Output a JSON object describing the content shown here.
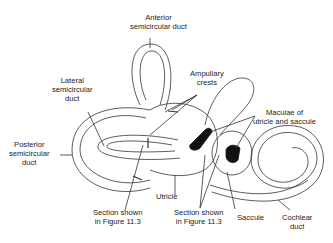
{
  "diagram": {
    "type": "anatomical-illustration",
    "colors": {
      "line": "#333333",
      "fill_dark": "#111111",
      "background": "#ffffff",
      "text": "#222222"
    },
    "labels": {
      "anterior": {
        "line1": "Anterior",
        "line2": "semicircular duct"
      },
      "lateral": {
        "line1": "Lateral",
        "line2": "semicircular",
        "line3": "duct"
      },
      "ampullary": {
        "line1": "Ampullary",
        "line2": "crests"
      },
      "maculae": {
        "line1": "Maculae of",
        "line2": "utricle and saccule"
      },
      "posterior": {
        "line1": "Posterior",
        "line2": "semicircular",
        "line3": "duct"
      },
      "utricle": {
        "line1": "Utricle"
      },
      "section_left": {
        "line1": "Section shown",
        "line2": "in Figure 11.3"
      },
      "section_right": {
        "line1": "Section shown",
        "line2": "in Figure 11.3"
      },
      "saccule": {
        "line1": "Saccule"
      },
      "cochlear": {
        "line1": "Cochlear",
        "line2": "duct"
      }
    }
  }
}
